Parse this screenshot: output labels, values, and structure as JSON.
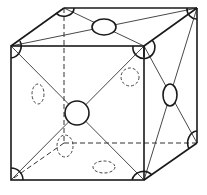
{
  "diagram": {
    "title": "",
    "structure": "face-centered cubic",
    "corner_atoms": 8,
    "face_center_atoms": 6,
    "visible_face_atoms": 3,
    "hidden_face_atoms": 3,
    "line_color": "#1a1a1a",
    "background_color": "#ffffff"
  }
}
